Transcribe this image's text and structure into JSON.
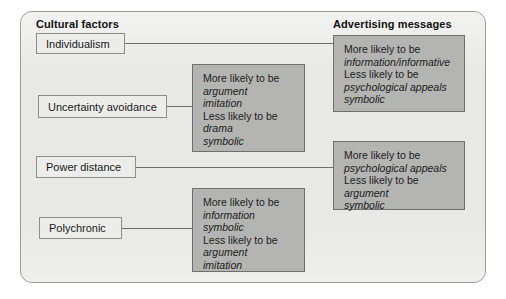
{
  "figure": {
    "columns": {
      "left_heading": "Cultural factors",
      "right_heading": "Advertising messages"
    },
    "cultural_factors": [
      {
        "label": "Individualism"
      },
      {
        "label": "Uncertainty avoidance"
      },
      {
        "label": "Power distance"
      },
      {
        "label": "Polychronic"
      }
    ],
    "message_boxes": [
      {
        "id": "individualism-messages",
        "more_lead": "More likely to be",
        "more_items": [
          "information/informative"
        ],
        "less_lead": "Less likely to be",
        "less_items": [
          "psychological appeals",
          "symbolic"
        ]
      },
      {
        "id": "uncertainty-avoidance-messages",
        "more_lead": "More likely to be",
        "more_items": [
          "argument",
          "imitation"
        ],
        "less_lead": "Less likely to be",
        "less_items": [
          "drama",
          "symbolic"
        ]
      },
      {
        "id": "power-distance-messages",
        "more_lead": "More likely to be",
        "more_items": [
          "psychological appeals"
        ],
        "less_lead": "Less likely to be",
        "less_items": [
          "argument",
          "symbolic"
        ]
      },
      {
        "id": "polychronic-messages",
        "more_lead": "More likely to be",
        "more_items": [
          "information",
          "symbolic"
        ],
        "less_lead": "Less likely to be",
        "less_items": [
          "argument",
          "imitation"
        ]
      }
    ],
    "colors": {
      "panel_background": "#e8e8e6",
      "panel_border": "#9a9a98",
      "factor_box_fill": "#ececea",
      "factor_box_border": "#8d8d8b",
      "message_box_fill": "#b4b4b2",
      "message_box_border": "#6f6f6d",
      "connector": "#6e6e6c",
      "text": "#1a1a1a"
    }
  }
}
